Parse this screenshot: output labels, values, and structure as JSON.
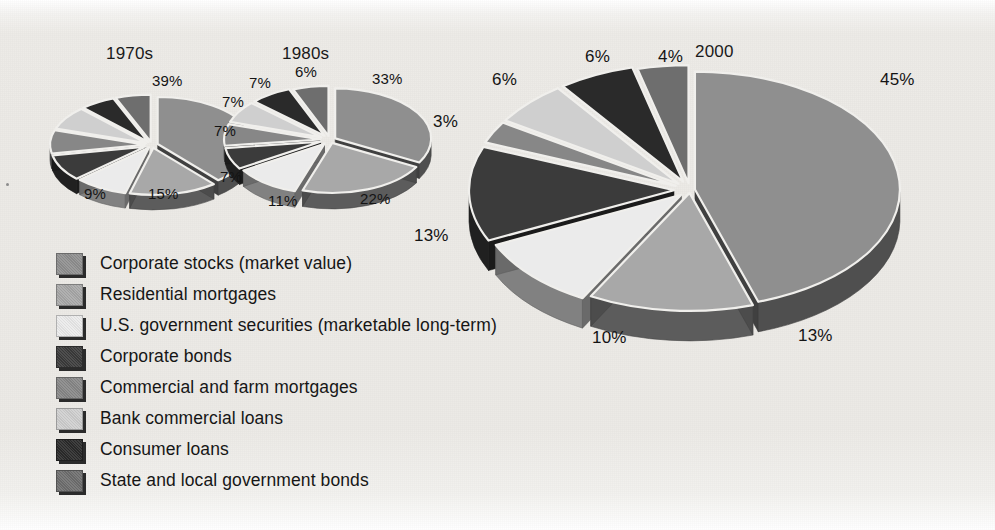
{
  "chart_data": [
    {
      "type": "pie",
      "title": "1970s",
      "labels_shown": [
        "39%",
        "15%",
        "9%"
      ],
      "categories": [
        "Corporate stocks (market value)",
        "Residential mortgages",
        "U.S. government securities (marketable long-term)",
        "Corporate bonds",
        "Commercial and farm mortgages",
        "Bank commercial loans",
        "Consumer loans",
        "State and local government bonds"
      ],
      "values": [
        39,
        15,
        9,
        9,
        8,
        8,
        6,
        6
      ],
      "value_labels": [
        "39%",
        "15%",
        "9%",
        "",
        "",
        "",
        "",
        ""
      ]
    },
    {
      "type": "pie",
      "title": "1980s",
      "labels_shown": [
        "33%",
        "22%",
        "11%",
        "7%",
        "7%",
        "7%",
        "7%",
        "6%"
      ],
      "categories": [
        "Corporate stocks (market value)",
        "Residential mortgages",
        "U.S. government securities (marketable long-term)",
        "Corporate bonds",
        "Commercial and farm mortgages",
        "Bank commercial loans",
        "Consumer loans",
        "State and local government bonds"
      ],
      "values": [
        33,
        22,
        11,
        7,
        7,
        7,
        7,
        6
      ],
      "value_labels": [
        "33%",
        "22%",
        "11%",
        "7%",
        "7%",
        "7%",
        "7%",
        "6%"
      ]
    },
    {
      "type": "pie",
      "title": "2000",
      "labels_shown": [
        "45%",
        "13%",
        "10%",
        "13%",
        "3%",
        "6%",
        "6%",
        "4%"
      ],
      "categories": [
        "Corporate stocks (market value)",
        "Residential mortgages",
        "U.S. government securities (marketable long-term)",
        "Corporate bonds",
        "Commercial and farm mortgages",
        "Bank commercial loans",
        "Consumer loans",
        "State and local government bonds"
      ],
      "values": [
        45,
        13,
        10,
        13,
        3,
        6,
        6,
        4
      ],
      "value_labels": [
        "45%",
        "13%",
        "10%",
        "13%",
        "3%",
        "6%",
        "6%",
        "4%"
      ],
      "legend_position": "below-left"
    }
  ],
  "legend": {
    "items": [
      {
        "label": "Corporate stocks (market value)",
        "color": "#8f8f8f"
      },
      {
        "label": "Residential mortgages",
        "color": "#a8a8a8"
      },
      {
        "label": "U.S. government securities (marketable long-term)",
        "color": "#ebebeb"
      },
      {
        "label": "Corporate bonds",
        "color": "#3b3b3b"
      },
      {
        "label": "Commercial and farm mortgages",
        "color": "#878787"
      },
      {
        "label": "Bank commercial loans",
        "color": "#cfcfcf"
      },
      {
        "label": "Consumer loans",
        "color": "#2a2a2a"
      },
      {
        "label": "State and local government bonds",
        "color": "#6e6e6e"
      }
    ]
  },
  "charts": {
    "c1970s": {
      "title": "1970s",
      "labels": [
        {
          "text": "39%",
          "x": 152,
          "y": 72
        },
        {
          "text": "15%",
          "x": 148,
          "y": 185
        },
        {
          "text": "9%",
          "x": 84,
          "y": 185
        }
      ]
    },
    "c1980s": {
      "title": "1980s",
      "labels": [
        {
          "text": "33%",
          "x": 372,
          "y": 70
        },
        {
          "text": "22%",
          "x": 360,
          "y": 190
        },
        {
          "text": "11%",
          "x": 268,
          "y": 192
        },
        {
          "text": "7%",
          "x": 220,
          "y": 168
        },
        {
          "text": "7%",
          "x": 214,
          "y": 122
        },
        {
          "text": "7%",
          "x": 222,
          "y": 93
        },
        {
          "text": "7%",
          "x": 249,
          "y": 74
        },
        {
          "text": "6%",
          "x": 295,
          "y": 63
        }
      ]
    },
    "c2000": {
      "title": "2000",
      "labels": [
        {
          "text": "45%",
          "x": 880,
          "y": 70
        },
        {
          "text": "13%",
          "x": 798,
          "y": 326
        },
        {
          "text": "10%",
          "x": 592,
          "y": 328
        },
        {
          "text": "13%",
          "x": 414,
          "y": 226
        },
        {
          "text": "3%",
          "x": 433,
          "y": 112
        },
        {
          "text": "6%",
          "x": 492,
          "y": 70
        },
        {
          "text": "6%",
          "x": 585,
          "y": 47
        },
        {
          "text": "4%",
          "x": 658,
          "y": 47
        }
      ]
    }
  }
}
